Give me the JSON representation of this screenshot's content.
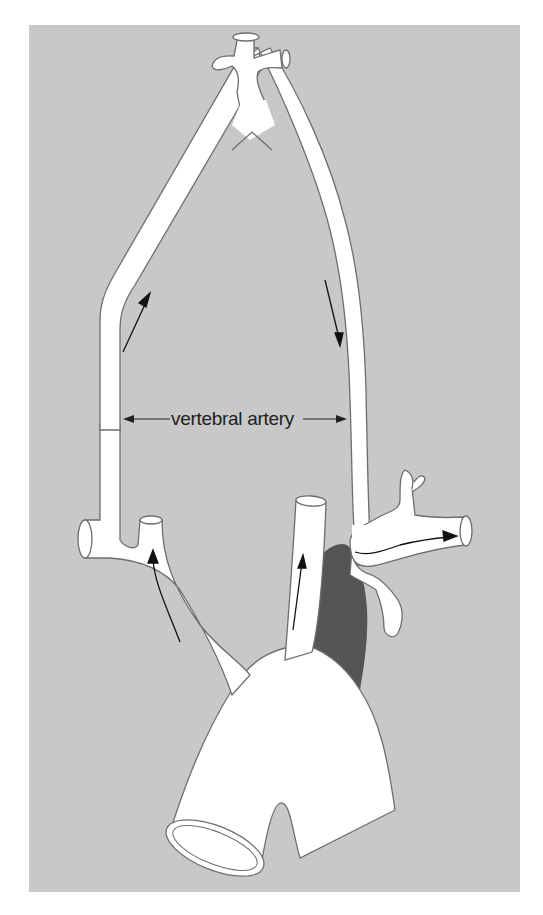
{
  "figure": {
    "type": "anatomical-diagram",
    "labels": [
      {
        "id": "vertebral-artery",
        "text": "vertebral artery"
      }
    ],
    "flow_arrows": [
      {
        "vessel": "right vertebral artery",
        "direction": "up"
      },
      {
        "vessel": "left vertebral artery",
        "direction": "down"
      },
      {
        "vessel": "right common carotid",
        "direction": "up"
      },
      {
        "vessel": "left common carotid",
        "direction": "up"
      },
      {
        "vessel": "left subclavian (distal)",
        "direction": "right"
      }
    ],
    "colors": {
      "background": "#c8c8c8",
      "vessel_fill": "#ffffff",
      "vessel_outline": "#6e6e6e",
      "occluded_segment": "#555555",
      "arrow": "#111111",
      "page": "#ffffff"
    }
  }
}
